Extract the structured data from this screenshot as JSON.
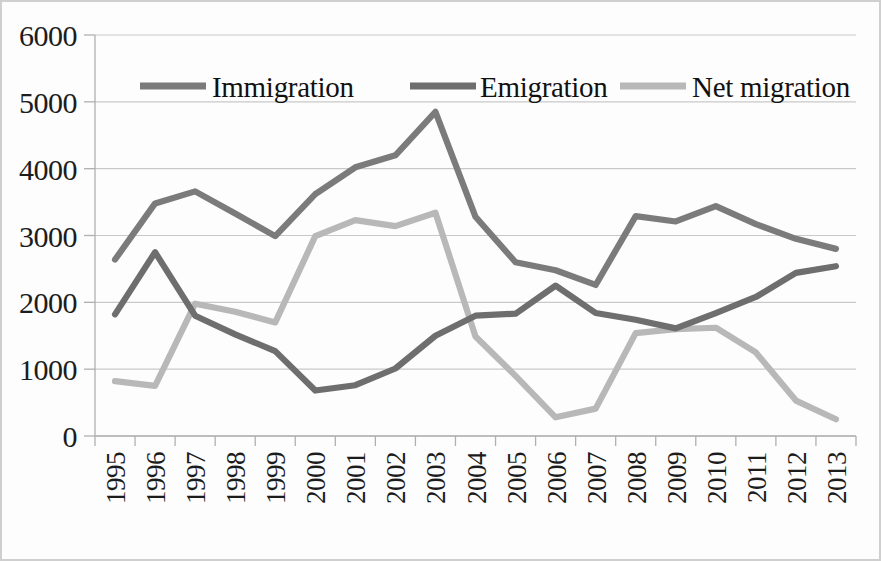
{
  "chart_data": {
    "type": "line",
    "title": "",
    "xlabel": "",
    "ylabel": "",
    "x": [
      1995,
      1996,
      1997,
      1998,
      1999,
      2000,
      2001,
      2002,
      2003,
      2004,
      2005,
      2006,
      2007,
      2008,
      2009,
      2010,
      2011,
      2012,
      2013
    ],
    "categories": [
      "1995",
      "1996",
      "1997",
      "1998",
      "1999",
      "2000",
      "2001",
      "2002",
      "2003",
      "2004",
      "2005",
      "2006",
      "2007",
      "2008",
      "2009",
      "2010",
      "2011",
      "2012",
      "2013"
    ],
    "series": [
      {
        "name": "Immigration",
        "color": "#7b7b7b",
        "values": [
          2640,
          3480,
          3660,
          3330,
          2990,
          3620,
          4020,
          4200,
          4850,
          3280,
          2600,
          2480,
          2260,
          3290,
          3210,
          3440,
          3170,
          2950,
          2800
        ]
      },
      {
        "name": "Emigration",
        "color": "#6e6e6e",
        "values": [
          1820,
          2750,
          1800,
          1520,
          1270,
          680,
          760,
          1010,
          1500,
          1800,
          1830,
          2250,
          1840,
          1740,
          1610,
          1840,
          2080,
          2440,
          2540
        ]
      },
      {
        "name": "Net migration",
        "color": "#b8b8b8",
        "values": [
          820,
          750,
          1980,
          1860,
          1700,
          2990,
          3230,
          3140,
          3340,
          1490,
          900,
          280,
          410,
          1540,
          1600,
          1620,
          1250,
          530,
          250
        ]
      }
    ],
    "ylim": [
      0,
      6000
    ],
    "ytick_step": 1000,
    "yticks": [
      "0",
      "1000",
      "2000",
      "3000",
      "4000",
      "5000",
      "6000"
    ],
    "grid": true,
    "legend_position": "top-inside"
  },
  "legend": {
    "items": [
      {
        "label": "Immigration",
        "color": "#7b7b7b"
      },
      {
        "label": "Emigration",
        "color": "#6e6e6e"
      },
      {
        "label": "Net migration",
        "color": "#b8b8b8"
      }
    ]
  },
  "style": {
    "grid_color": "#c9c9c9",
    "axis_color": "#b0b0b0",
    "text_color": "#1c1c1c",
    "background": "#fdfdfd"
  }
}
